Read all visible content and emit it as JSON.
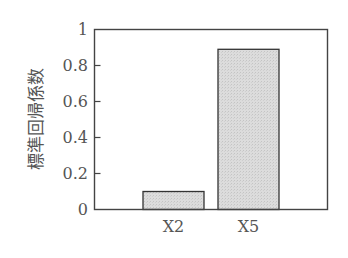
{
  "chart_data": {
    "type": "bar",
    "title": "",
    "xlabel": "",
    "ylabel": "標準回帰係数",
    "categories": [
      "X2",
      "X5"
    ],
    "values": [
      0.1,
      0.89
    ],
    "ylim": [
      0,
      1
    ],
    "yticks": [
      0,
      0.2,
      0.4,
      0.6,
      0.8,
      1
    ],
    "ytick_labels": [
      "0",
      "0.2",
      "0.4",
      "0.6",
      "0.8",
      "1"
    ],
    "grid": false,
    "legend": null,
    "bar_fill": "#d9d9d9",
    "bar_edge": "#333333",
    "axis_color": "#444444"
  }
}
